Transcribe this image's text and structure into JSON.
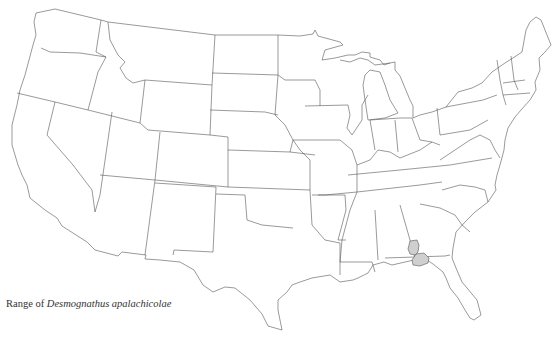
{
  "caption": {
    "prefix": "Range of ",
    "species": "Desmognathus apalachicolae"
  },
  "map": {
    "region": "Contiguous United States",
    "style": "state outline map",
    "outline_color": "#555555",
    "background_color": "#ffffff",
    "range_fill_color": "#cfcfcf",
    "range_areas": [
      {
        "id": "range-patch-north",
        "location": "southeast Alabama / southwest Georgia near Chattahoochee River"
      },
      {
        "id": "range-patch-south",
        "location": "Florida panhandle / southwest Georgia near Apalachicola River"
      }
    ]
  }
}
